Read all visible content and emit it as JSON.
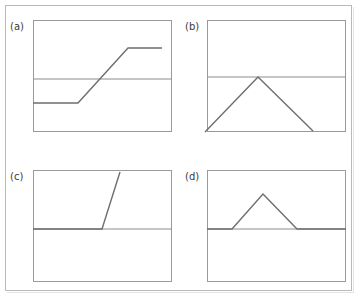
{
  "figure": {
    "caption_labels": [
      "(a)",
      "(b)",
      "(c)",
      "(d)"
    ],
    "background_color": "#ffffff",
    "frame_color": "#b9b9b9",
    "box_color": "#9a9a9a",
    "curve_color": "#6e6e6e",
    "reference_line_color": "#8c8c8c"
  },
  "chart_data": [
    {
      "type": "line",
      "title": "(a)",
      "xlabel": "",
      "ylabel": "",
      "xlim": [
        0,
        100
      ],
      "ylim": [
        0,
        100
      ],
      "grid": false,
      "legend": "none",
      "annotations": [
        "horizontal reference line at y = 50"
      ],
      "reference_lines": [
        {
          "orientation": "horizontal",
          "y": 50
        }
      ],
      "series": [
        {
          "name": "ramp",
          "x": [
            0,
            36,
            80,
            100
          ],
          "y": [
            30,
            30,
            78,
            78
          ]
        }
      ]
    },
    {
      "type": "line",
      "title": "(b)",
      "xlabel": "",
      "ylabel": "",
      "xlim": [
        0,
        100
      ],
      "ylim": [
        0,
        100
      ],
      "grid": false,
      "legend": "none",
      "annotations": [
        "horizontal reference line at y = 50",
        "peak touches reference line"
      ],
      "reference_lines": [
        {
          "orientation": "horizontal",
          "y": 50
        }
      ],
      "series": [
        {
          "name": "triangle-peak",
          "x": [
            3,
            48,
            100
          ],
          "y": [
            4,
            50,
            5
          ]
        }
      ]
    },
    {
      "type": "line",
      "title": "(c)",
      "xlabel": "",
      "ylabel": "",
      "xlim": [
        0,
        100
      ],
      "ylim": [
        0,
        100
      ],
      "grid": false,
      "legend": "none",
      "annotations": [
        "horizontal reference line at y = 41",
        "steep rise exits top of plot box"
      ],
      "reference_lines": [
        {
          "orientation": "horizontal",
          "y": 41
        }
      ],
      "series": [
        {
          "name": "step-rise",
          "x": [
            0,
            46,
            58
          ],
          "y": [
            41,
            41,
            100
          ]
        }
      ]
    },
    {
      "type": "line",
      "title": "(d)",
      "xlabel": "",
      "ylabel": "",
      "xlim": [
        0,
        100
      ],
      "ylim": [
        0,
        100
      ],
      "grid": false,
      "legend": "none",
      "annotations": [
        "horizontal reference line at y = 41",
        "triangular bump above baseline"
      ],
      "reference_lines": [
        {
          "orientation": "horizontal",
          "y": 41
        }
      ],
      "series": [
        {
          "name": "bump",
          "x": [
            0,
            29,
            51,
            75,
            100
          ],
          "y": [
            41,
            41,
            78,
            41,
            41
          ]
        }
      ]
    }
  ],
  "panels": [
    {
      "id": "panel-a",
      "label": "(a)",
      "label_pos": {
        "x": 10,
        "y": 22
      },
      "box": {
        "x": 33,
        "y": 20,
        "w": 139,
        "h": 112
      },
      "ref_line_y": 79,
      "polyline": "33,103 78,103 128,48 162,48",
      "clip": false
    },
    {
      "id": "panel-b",
      "label": "(b)",
      "label_pos": {
        "x": 185,
        "y": 22
      },
      "box": {
        "x": 207,
        "y": 20,
        "w": 139,
        "h": 112
      },
      "ref_line_y": 77,
      "polyline": "205,132 258,77 313,131",
      "clip": false
    },
    {
      "id": "panel-c",
      "label": "(c)",
      "label_pos": {
        "x": 10,
        "y": 172
      },
      "box": {
        "x": 33,
        "y": 170,
        "w": 139,
        "h": 112
      },
      "ref_line_y": 229,
      "polyline": "33,229 102,229 120,172",
      "clip": false
    },
    {
      "id": "panel-d",
      "label": "(d)",
      "label_pos": {
        "x": 185,
        "y": 172
      },
      "box": {
        "x": 207,
        "y": 170,
        "w": 139,
        "h": 112
      },
      "ref_line_y": 229,
      "polyline": "207,229 232,229 263,194 297,229 346,229",
      "clip": false
    }
  ]
}
